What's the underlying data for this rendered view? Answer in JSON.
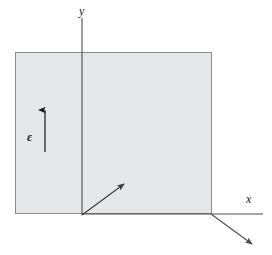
{
  "figure": {
    "title": "",
    "background_color": "#ffffff"
  },
  "plane": {
    "name": "shaded-plane",
    "fill_color": "#e6e7e8",
    "stroke_color": "#8c8c8c",
    "x": 15,
    "y": 52,
    "width": 197,
    "height": 162
  },
  "axes": {
    "origin": {
      "x": 82,
      "y": 214
    },
    "color": "#4d4d4d",
    "items": [
      {
        "id": "y-axis",
        "label": "y",
        "label_x": 82,
        "label_y": 13,
        "x1": 82,
        "y1": 18,
        "x2": 82,
        "y2": 215,
        "arrow": false
      },
      {
        "id": "x-axis",
        "label": "x",
        "label_x": 250,
        "label_y": 202,
        "x1": 82,
        "y1": 214,
        "x2": 263,
        "y2": 214,
        "arrow": false
      },
      {
        "id": "z-axis",
        "label": "",
        "label_x": 0,
        "label_y": 0,
        "x1": 211,
        "y1": 214,
        "x2": 255,
        "y2": 247,
        "arrow": true
      }
    ]
  },
  "vectors": [
    {
      "id": "field-vector",
      "label": "ε",
      "label_x": 31,
      "label_y": 140,
      "x1": 45,
      "y1": 152,
      "x2": 45,
      "y2": 103,
      "color": "#1a1a1a"
    },
    {
      "id": "propagation-vector",
      "label": "",
      "label_x": 0,
      "label_y": 0,
      "x1": 82,
      "y1": 215,
      "x2": 127,
      "y2": 181,
      "color": "#3a3a3a"
    }
  ],
  "colors": {
    "plane_fill": "#e6e7e8",
    "plane_stroke": "#8c8c8c",
    "axis": "#4d4d4d",
    "vector": "#1a1a1a",
    "text": "#111111"
  }
}
